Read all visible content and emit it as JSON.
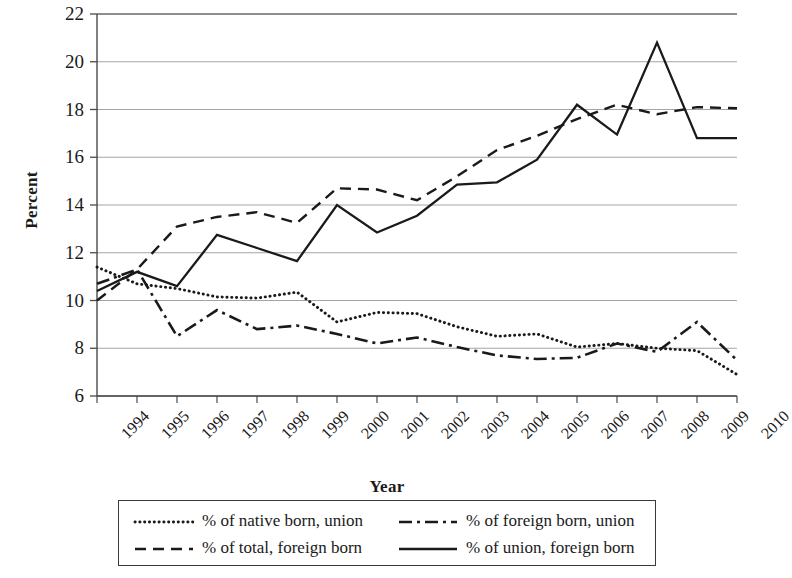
{
  "axes": {
    "ylabel": "Percent",
    "xlabel": "Year",
    "yticks": [
      "6",
      "8",
      "10",
      "12",
      "14",
      "16",
      "18",
      "20",
      "22"
    ],
    "xticks": [
      "1994",
      "1995",
      "1996",
      "1997",
      "1998",
      "1999",
      "2000",
      "2001",
      "2002",
      "2003",
      "2004",
      "2005",
      "2006",
      "2007",
      "2008",
      "2009",
      "2010"
    ]
  },
  "legend": {
    "items": [
      {
        "label": "% of native born, union",
        "style": "dotted",
        "color": "#1a1a1a"
      },
      {
        "label": "% of foreign born, union",
        "style": "dashdot",
        "color": "#1a1a1a"
      },
      {
        "label": "% of total, foreign born",
        "style": "dashed",
        "color": "#1a1a1a"
      },
      {
        "label": "% of union, foreign born",
        "style": "solid",
        "color": "#1a1a1a"
      }
    ]
  },
  "chart_data": {
    "type": "line",
    "title": "",
    "xlabel": "Year",
    "ylabel": "Percent",
    "grid": true,
    "legend_position": "bottom",
    "x": [
      1994,
      1995,
      1996,
      1997,
      1998,
      1999,
      2000,
      2001,
      2002,
      2003,
      2004,
      2005,
      2006,
      2007,
      2008,
      2009,
      2010
    ],
    "xlim": [
      1994,
      2010
    ],
    "ylim": [
      6,
      22
    ],
    "ytick_step": 2,
    "series": [
      {
        "name": "% of native born, union",
        "style": "dotted",
        "values": [
          11.4,
          10.7,
          10.5,
          10.15,
          10.1,
          10.35,
          9.1,
          9.5,
          9.45,
          8.9,
          8.5,
          8.6,
          8.05,
          8.2,
          8.0,
          7.9,
          6.9
        ]
      },
      {
        "name": "% of foreign born, union",
        "style": "dashdot",
        "values": [
          10.7,
          11.3,
          8.5,
          9.6,
          8.8,
          8.95,
          8.6,
          8.2,
          8.45,
          8.05,
          7.7,
          7.55,
          7.6,
          8.2,
          7.85,
          9.1,
          7.5
        ]
      },
      {
        "name": "% of total, foreign born",
        "style": "dashed",
        "values": [
          10.0,
          11.3,
          13.1,
          13.5,
          13.7,
          13.25,
          14.7,
          14.65,
          14.2,
          15.2,
          16.3,
          16.9,
          17.6,
          18.2,
          17.8,
          18.1,
          18.05
        ]
      },
      {
        "name": "% of union, foreign born",
        "style": "solid",
        "values": [
          10.4,
          11.2,
          10.6,
          12.75,
          12.2,
          11.65,
          14.0,
          12.85,
          13.55,
          14.85,
          14.95,
          15.9,
          18.2,
          16.95,
          20.8,
          16.8,
          16.8
        ]
      }
    ]
  },
  "plot_geometry": {
    "left": 97,
    "right": 737,
    "top": 14,
    "bottom": 396
  }
}
